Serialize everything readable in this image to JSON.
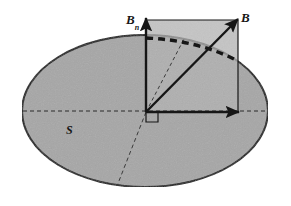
{
  "figure": {
    "background_color": "#ffffff",
    "surface_fill_color": "#a6a6a6",
    "square_fill_color": "#b0b0b0",
    "stroke_color": "#161616",
    "labels": {
      "normal_component": "B",
      "normal_component_subscript": "n",
      "field_vector": "B",
      "surface": "S"
    },
    "elements": {
      "ellipse_name": "surface-ellipse",
      "square_name": "projection-square",
      "vector_b_name": "vector-b-arrow",
      "vector_bn_name": "vector-bn-arrow",
      "baseline_arrow_name": "horizontal-arrow",
      "arc_name": "dashed-arc",
      "right_angle_name": "right-angle-marker",
      "ellipse_major_axis_name": "ellipse-major-axis-dashed",
      "ellipse_minor_axis_name": "ellipse-minor-axis-dashed",
      "angle_ray_name": "angle-ray-dashed"
    },
    "geometry": {
      "ellipse_center_x": 145,
      "ellipse_center_y": 111,
      "ellipse_radius_x": 123,
      "ellipse_radius_y": 76,
      "origin_x": 146,
      "origin_y": 112,
      "square_left": 146,
      "square_top": 20,
      "square_right": 238,
      "square_bottom": 112
    }
  }
}
